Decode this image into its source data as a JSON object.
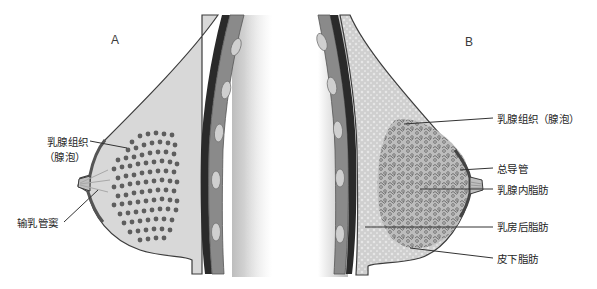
{
  "figure": {
    "panels": [
      {
        "id": "A",
        "letter": "A",
        "labels": [
          {
            "line1": "乳腺组织",
            "line2": "（腺泡）"
          },
          {
            "text": "输乳管窦"
          }
        ]
      },
      {
        "id": "B",
        "letter": "B",
        "labels": [
          {
            "text": "乳腺组织（腺泡）"
          },
          {
            "text": "总导管"
          },
          {
            "text": "乳腺内脂肪"
          },
          {
            "text": "乳房后脂肪"
          },
          {
            "text": "皮下脂肪"
          }
        ]
      }
    ],
    "colors": {
      "background": "#ffffff",
      "breast_fill_a": "#d8d8d8",
      "breast_fill_b": "#d2d2d2",
      "acini_dots": "#5e5e5e",
      "chest_dark_band": "#2a2a2a",
      "rib_band": "#8a8a8a",
      "rib_bone": "#cfcfcf",
      "outline": "#3c3c3c",
      "leader_line": "#333333"
    }
  }
}
